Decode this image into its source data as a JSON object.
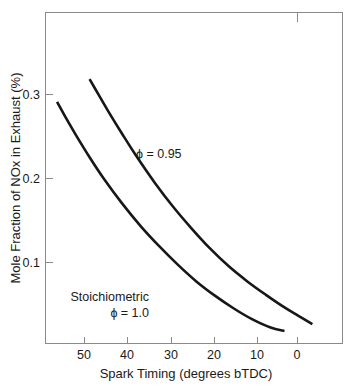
{
  "chart_data": {
    "type": "line",
    "title": "",
    "xlabel": "Spark Timing (degrees bTDC)",
    "ylabel": "Mole Fraction of NOx in Exhaust (%)",
    "xlim": [
      53.5,
      -10.5
    ],
    "ylim": [
      0.0,
      0.3945
    ],
    "x_reversed": true,
    "grid": false,
    "legend": "none",
    "x_ticks": [
      50,
      40,
      30,
      20,
      10,
      0
    ],
    "x_tick_labels": [
      "50",
      "40",
      "30",
      "20",
      "10",
      "0"
    ],
    "y_ticks": [
      0.1,
      0.2,
      0.3
    ],
    "y_tick_labels": [
      "0.1",
      "0.2",
      "0.3"
    ],
    "series": [
      {
        "name": "phi = 0.95",
        "annotation": "ϕ = 0.95",
        "x": [
          44,
          42,
          40,
          37,
          34,
          30,
          26,
          22,
          18,
          14,
          10,
          6,
          2,
          -1,
          -4
        ],
        "y": [
          0.315,
          0.296,
          0.277,
          0.25,
          0.224,
          0.192,
          0.163,
          0.137,
          0.113,
          0.092,
          0.074,
          0.058,
          0.043,
          0.033,
          0.023
        ]
      },
      {
        "name": "Stoichiometric phi = 1.0",
        "annotation_line1": "Stoichiometric",
        "annotation_line2": "ϕ = 1.0",
        "x": [
          51,
          49,
          47,
          44,
          41,
          37,
          33,
          29,
          25,
          21,
          17,
          13,
          9,
          5,
          2
        ],
        "y": [
          0.288,
          0.268,
          0.249,
          0.222,
          0.197,
          0.167,
          0.14,
          0.116,
          0.094,
          0.074,
          0.057,
          0.042,
          0.029,
          0.019,
          0.015
        ]
      }
    ]
  },
  "annotations": {
    "phi_095": "ϕ = 0.95",
    "stoichiometric_label": "Stoichiometric",
    "phi_10": "ϕ = 1.0"
  },
  "axes": {
    "x_title": "Spark Timing (degrees bTDC)",
    "y_title": "Mole Fraction of NOx in Exhaust (%)",
    "x_tick_labels": [
      "50",
      "40",
      "30",
      "20",
      "10",
      "0"
    ],
    "y_tick_labels": [
      "0.1",
      "0.2",
      "0.3"
    ]
  },
  "colors": {
    "curve": "#171717",
    "frame": "#8a8a8a",
    "text": "#1a1a1a",
    "background": "#ffffff"
  }
}
